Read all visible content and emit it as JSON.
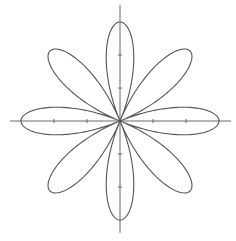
{
  "chart_data": {
    "type": "line",
    "subtype": "polar-rose",
    "title": "",
    "xlabel": "",
    "ylabel": "",
    "equation": "r = cos(4θ)",
    "petals": 8,
    "petal_angles_deg": [
      0,
      45,
      90,
      135,
      180,
      225,
      270,
      315
    ],
    "r_max": 1,
    "xlim": [
      -1.11,
      1.12
    ],
    "ylim": [
      -1.13,
      1.17
    ],
    "x_ticks": [
      -0.667,
      -0.333,
      0.333,
      0.667
    ],
    "y_ticks": [
      -0.667,
      -0.333,
      0.333,
      0.667
    ],
    "tick_labels_shown": false,
    "grid": false,
    "legend": null,
    "samples": 720
  },
  "layout": {
    "center_px": [
      120,
      121
    ],
    "radius_px": 99,
    "x_axis_px": [
      10,
      231
    ],
    "y_axis_px": [
      5,
      233
    ],
    "tick_len_px": 4
  },
  "colors": {
    "background": "#ffffff",
    "curve": "#555555",
    "axis": "#6a6a6a"
  }
}
